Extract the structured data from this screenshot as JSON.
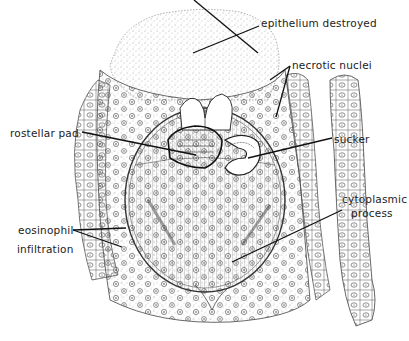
{
  "figure": {
    "type": "histological-illustration",
    "colors": {
      "ink": "#222222",
      "background": "#ffffff",
      "stipple": "#555555"
    },
    "labels": [
      {
        "id": "epithelium",
        "text": "epithelium destroyed",
        "x": 261,
        "y": 17
      },
      {
        "id": "necrotic",
        "text": "necrotic nuclei",
        "x": 292,
        "y": 59
      },
      {
        "id": "rostellar",
        "text": "rostellar pad",
        "x": 10,
        "y": 127
      },
      {
        "id": "sucker",
        "text": "sucker",
        "x": 334,
        "y": 133
      },
      {
        "id": "cytoplasmic1",
        "text": "cytoplasmic",
        "x": 342,
        "y": 193
      },
      {
        "id": "cytoplasmic2",
        "text": "process",
        "x": 351,
        "y": 207
      },
      {
        "id": "eosinophil1",
        "text": "eosinophil",
        "x": 18,
        "y": 224
      },
      {
        "id": "eosinophil2",
        "text": "infiltration",
        "x": 17,
        "y": 243
      }
    ]
  }
}
